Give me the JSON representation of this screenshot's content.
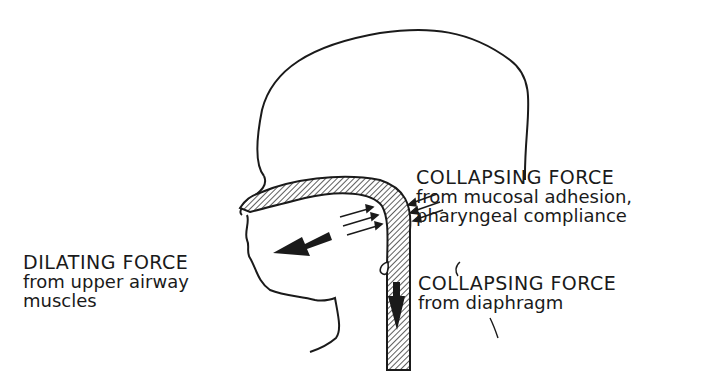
{
  "figure": {
    "colors": {
      "line": "#1a1a1a",
      "background": "#ffffff"
    },
    "labels": {
      "collapsing_mucosal": {
        "title": "COLLAPSING FORCE",
        "line1": "from mucosal adhesion,",
        "line2": "pharyngeal compliance"
      },
      "dilating": {
        "title": "DILATING FORCE",
        "line1": "from upper airway",
        "line2": "muscles"
      },
      "collapsing_diaphragm": {
        "title": "COLLAPSING FORCE",
        "line1": "from diaphragm"
      }
    },
    "arrows": [
      {
        "name": "dilating-arrow",
        "direction": "outward-forward"
      },
      {
        "name": "mucosal-collapse-arrows",
        "direction": "inward",
        "count": 6
      },
      {
        "name": "diaphragm-arrow",
        "direction": "downward"
      }
    ]
  }
}
